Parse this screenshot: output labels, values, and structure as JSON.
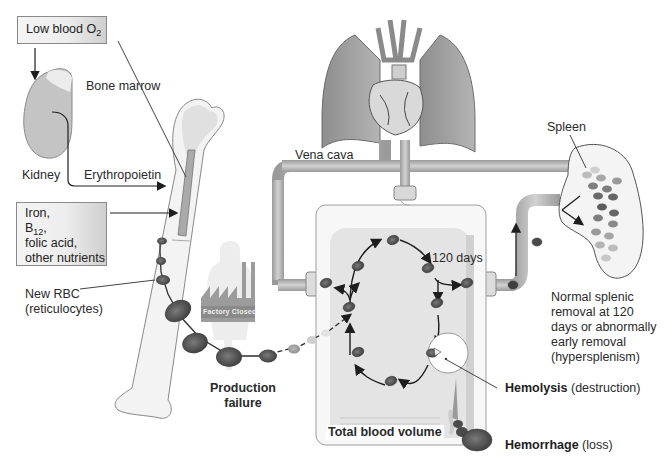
{
  "diagram": {
    "style": "grayscale medical illustration"
  },
  "labels": {
    "low_blood_o2": {
      "text": "Low blood O",
      "sub": "2"
    },
    "kidney": "Kidney",
    "erythropoietin": "Erythropoietin",
    "bone_marrow": "Bone marrow",
    "nutrients": {
      "line1": "Iron,",
      "line2_main": "B",
      "line2_sub": "12",
      "line2_tail": ",",
      "line3": "folic acid,",
      "line4": "other nutrients"
    },
    "new_rbc": {
      "line1": "New RBC",
      "line2": "(reticulocytes)"
    },
    "factory_sign": "Factory Closed",
    "production_failure": {
      "line1": "Production",
      "line2": "failure"
    },
    "vena_cava": "Vena cava",
    "spleen": "Spleen",
    "days_120": "120 days",
    "splenic_removal": {
      "line1": "Normal splenic",
      "line2": "removal at 120",
      "line3": "days or abnormally",
      "line4": "early removal",
      "line5": "(hyperspleniism)"
    },
    "hemolysis": {
      "bold": "Hemolysis",
      "rest": " (destruction)"
    },
    "total_blood_volume": "Total blood volume",
    "hemorrhage": {
      "bold": "Hemorrhage",
      "rest": " (loss)"
    }
  },
  "colors": {
    "rbc": "#5a5a5a",
    "pipe": "#b8b8b8",
    "outline": "#6e6e6e",
    "reservoir": "#e6e6e6",
    "lung": "#9c9c9c"
  }
}
